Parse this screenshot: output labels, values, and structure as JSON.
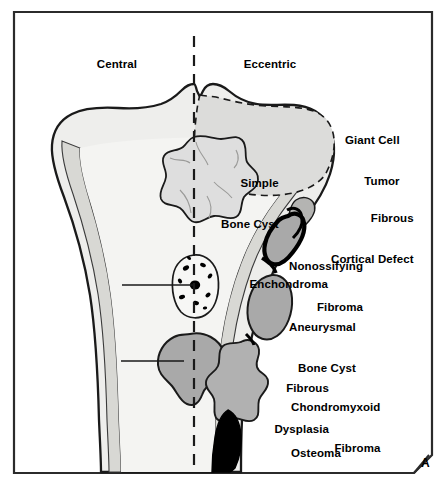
{
  "figure": {
    "panel_letter": "A",
    "caption_region_headers": {
      "left": "Central",
      "right": "Eccentric"
    }
  },
  "colors": {
    "outline": "#1a1a1a",
    "bone_fill": "#eeeeec",
    "marrow_fill": "#f4f4f2",
    "cortex_fill": "#d8d8d4",
    "lesion_gray": "#a9a9a9",
    "lesion_light_gray": "#c8c8c6",
    "lesion_black": "#000000",
    "giant_cell_fill": "#dcdcda",
    "border": "#2b2b2b",
    "background": "#ffffff"
  },
  "headers": [
    {
      "id": "central",
      "label": "Central",
      "x": 117,
      "y": 58
    },
    {
      "id": "eccentric",
      "label": "Eccentric",
      "x": 270,
      "y": 58
    }
  ],
  "labels_left": [
    {
      "id": "simple-bone-cyst",
      "lines": [
        "Simple",
        "Bone Cyst"
      ],
      "right": 301,
      "top": 150,
      "has_leader": false
    },
    {
      "id": "enchondroma",
      "lines": [
        "Enchondroma"
      ],
      "right": 328,
      "top": 278,
      "has_leader": true,
      "leader": {
        "x1": 122,
        "y1": 285,
        "x2": 193,
        "y2": 285
      }
    },
    {
      "id": "fibrous-dysplasia",
      "lines": [
        "Fibrous",
        "Dysplasia"
      ],
      "right": 329,
      "top": 355,
      "has_leader": true,
      "leader": {
        "x1": 121,
        "y1": 361,
        "x2": 183,
        "y2": 361
      }
    }
  ],
  "labels_right": [
    {
      "id": "giant-cell-tumor",
      "lines": [
        "Giant Cell",
        "Tumor"
      ],
      "left": 345,
      "top": 107
    },
    {
      "id": "fibrous-cortical-defect",
      "lines": [
        "Fibrous",
        "Cortical Defect"
      ],
      "left": 331,
      "top": 185
    },
    {
      "id": "nonossifying-fibroma",
      "lines": [
        "Nonossifying",
        "Fibroma"
      ],
      "left": 289,
      "top": 233
    },
    {
      "id": "aneurysmal-bone-cyst",
      "lines": [
        "Aneurysmal",
        "Bone Cyst"
      ],
      "left": 289,
      "top": 294
    },
    {
      "id": "chondromyxoid-fibroma",
      "lines": [
        "Chondromyxoid",
        "Fibroma"
      ],
      "left": 291,
      "top": 374
    },
    {
      "id": "osteoma",
      "lines": [
        "Osteoma"
      ],
      "left": 291,
      "top": 447
    }
  ],
  "lesions": [
    {
      "id": "giant-cell-tumor-region",
      "name": "Giant Cell Tumor",
      "position": "eccentric-epiphyseal",
      "rendering": "dashed-outline-gray-fill"
    },
    {
      "id": "simple-bone-cyst-lesion",
      "name": "Simple Bone Cyst",
      "position": "central-metaphyseal",
      "rendering": "scalloped-light-gray"
    },
    {
      "id": "fibrous-cortical-defect-lesion",
      "name": "Fibrous Cortical Defect",
      "position": "eccentric-cortical",
      "rendering": "small-gray-cortical"
    },
    {
      "id": "nonossifying-fibroma-lesion",
      "name": "Nonossifying Fibroma",
      "position": "eccentric-cortical",
      "rendering": "gray-with-thick-black-rim"
    },
    {
      "id": "enchondroma-lesion",
      "name": "Enchondroma",
      "position": "central-diaphyseal",
      "rendering": "outlined-with-black-calcific-stippling"
    },
    {
      "id": "aneurysmal-bone-cyst-lesion",
      "name": "Aneurysmal Bone Cyst",
      "position": "eccentric-expansile",
      "rendering": "gray-oval-expansile"
    },
    {
      "id": "fibrous-dysplasia-lesion",
      "name": "Fibrous Dysplasia",
      "position": "central-diaphyseal",
      "rendering": "gray-ground-glass-blob"
    },
    {
      "id": "chondromyxoid-fibroma-lesion",
      "name": "Chondromyxoid Fibroma",
      "position": "eccentric-lobulated",
      "rendering": "gray-lobulated"
    },
    {
      "id": "osteoma-lesion",
      "name": "Osteoma",
      "position": "cortical-surface",
      "rendering": "solid-black-dense"
    }
  ],
  "midline": {
    "id": "midline-axis",
    "style": "dashed",
    "x": 194,
    "y1": 36,
    "y2": 472
  }
}
